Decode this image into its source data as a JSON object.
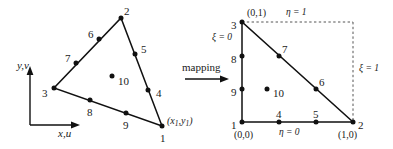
{
  "figure": {
    "type": "diagram",
    "mapping_label": "mapping",
    "physical_element": {
      "axis_labels": {
        "vertical": "y,v",
        "horizontal": "x,u"
      },
      "vertex_coord_label": "(x₁,y₁)",
      "nodes": [
        {
          "id": "1",
          "x": 162,
          "y": 126,
          "label_dx": -2,
          "label_dy": 13
        },
        {
          "id": "2",
          "x": 121,
          "y": 18,
          "label_dx": 3,
          "label_dy": -6
        },
        {
          "id": "3",
          "x": 54,
          "y": 88,
          "label_dx": -12,
          "label_dy": 6
        },
        {
          "id": "4",
          "x": 148,
          "y": 90,
          "label_dx": 8,
          "label_dy": 4
        },
        {
          "id": "5",
          "x": 135,
          "y": 54,
          "label_dx": 6,
          "label_dy": -4
        },
        {
          "id": "6",
          "x": 99,
          "y": 39,
          "label_dx": -11,
          "label_dy": -4
        },
        {
          "id": "7",
          "x": 76,
          "y": 63,
          "label_dx": -11,
          "label_dy": -4
        },
        {
          "id": "8",
          "x": 90,
          "y": 100,
          "label_dx": -3,
          "label_dy": 13
        },
        {
          "id": "9",
          "x": 126,
          "y": 113,
          "label_dx": -3,
          "label_dy": 13
        },
        {
          "id": "10",
          "x": 112,
          "y": 76,
          "label_dx": 6,
          "label_dy": 6
        }
      ]
    },
    "natural_element": {
      "edge_labels": {
        "eta_top": "η = 1",
        "xi_left": "ξ = 0",
        "xi_right": "ξ = 1",
        "eta_bottom": "η = 0"
      },
      "corner_coords": {
        "node3": "(0,1)",
        "node1": "(0,0)",
        "node2": "(1,0)"
      },
      "nodes": [
        {
          "id": "1",
          "x": 242,
          "y": 122,
          "label_dx": -11,
          "label_dy": 4
        },
        {
          "id": "2",
          "x": 353,
          "y": 122,
          "label_dx": 5,
          "label_dy": 4
        },
        {
          "id": "3",
          "x": 242,
          "y": 22,
          "label_dx": -11,
          "label_dy": 4
        },
        {
          "id": "4",
          "x": 279,
          "y": 122,
          "label_dx": -3,
          "label_dy": -7
        },
        {
          "id": "5",
          "x": 316,
          "y": 122,
          "label_dx": -3,
          "label_dy": -7
        },
        {
          "id": "6",
          "x": 316,
          "y": 89,
          "label_dx": 3,
          "label_dy": -6
        },
        {
          "id": "7",
          "x": 279,
          "y": 56,
          "label_dx": 3,
          "label_dy": -6
        },
        {
          "id": "8",
          "x": 242,
          "y": 56,
          "label_dx": -11,
          "label_dy": 4
        },
        {
          "id": "9",
          "x": 242,
          "y": 89,
          "label_dx": -11,
          "label_dy": 4
        },
        {
          "id": "10",
          "x": 267,
          "y": 89,
          "label_dx": 6,
          "label_dy": 5
        }
      ]
    }
  }
}
